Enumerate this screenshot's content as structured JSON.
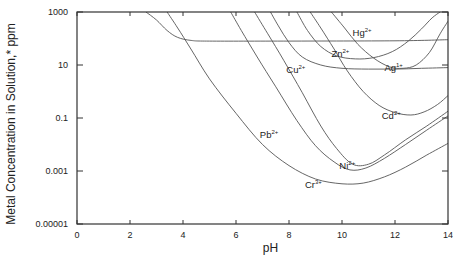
{
  "chart_data": {
    "type": "line",
    "title": "",
    "xlabel": "pH",
    "ylabel": "Metal Concentration in Solution,* ppm",
    "xlim": [
      0,
      14
    ],
    "ylim": [
      1e-05,
      1000
    ],
    "yscale": "log",
    "grid": false,
    "legend": "inline labels on curves",
    "x_ticks": [
      0,
      2,
      4,
      6,
      8,
      10,
      12,
      14
    ],
    "x_tick_labels": [
      "0",
      "2",
      "4",
      "6",
      "8",
      "10",
      "12",
      "14"
    ],
    "y_ticks": [
      1000,
      10,
      0.1,
      0.001,
      1e-05
    ],
    "y_tick_labels": [
      "1000",
      "10",
      "0.1",
      "0.001",
      "0.00001"
    ],
    "series": [
      {
        "name": "Hg2+",
        "base": "Hg",
        "charge": "2+",
        "label_pos": [
          10.4,
          120
        ],
        "points": [
          [
            2.6,
            1000
          ],
          [
            3.0,
            500
          ],
          [
            3.4,
            200
          ],
          [
            3.8,
            110
          ],
          [
            4.3,
            85
          ],
          [
            5,
            80
          ],
          [
            8,
            80
          ],
          [
            12,
            82
          ],
          [
            14,
            90
          ]
        ]
      },
      {
        "name": "Cr3+",
        "base": "Cr",
        "charge": "3+",
        "label_pos": [
          8.6,
          0.00022
        ],
        "points": [
          [
            3.4,
            1000
          ],
          [
            3.8,
            250
          ],
          [
            4.3,
            40
          ],
          [
            5,
            3
          ],
          [
            6,
            0.15
          ],
          [
            7,
            0.01
          ],
          [
            8,
            0.0016
          ],
          [
            9,
            0.0005
          ],
          [
            10,
            0.00033
          ],
          [
            10.8,
            0.00035
          ],
          [
            11.6,
            0.0006
          ],
          [
            12.4,
            0.0014
          ],
          [
            13.2,
            0.004
          ],
          [
            14,
            0.011
          ]
        ]
      },
      {
        "name": "Pb2+",
        "base": "Pb",
        "charge": "2+",
        "label_pos": [
          6.9,
          0.018
        ],
        "points": [
          [
            5.8,
            1000
          ],
          [
            6.2,
            200
          ],
          [
            6.8,
            20
          ],
          [
            7.5,
            1.5
          ],
          [
            8.3,
            0.08
          ],
          [
            9,
            0.009
          ],
          [
            9.7,
            0.0022
          ],
          [
            10.3,
            0.0011
          ],
          [
            10.9,
            0.0013
          ],
          [
            11.6,
            0.003
          ],
          [
            12.4,
            0.01
          ],
          [
            13.2,
            0.035
          ],
          [
            14,
            0.12
          ]
        ]
      },
      {
        "name": "Ni2+",
        "base": "Ni",
        "charge": "2+",
        "label_pos": [
          9.9,
          0.0012
        ],
        "points": [
          [
            6.7,
            1000
          ],
          [
            7.2,
            150
          ],
          [
            7.8,
            15
          ],
          [
            8.5,
            0.9
          ],
          [
            9.2,
            0.05
          ],
          [
            9.8,
            0.007
          ],
          [
            10.4,
            0.0018
          ],
          [
            11,
            0.0018
          ],
          [
            11.6,
            0.004
          ],
          [
            12.4,
            0.015
          ],
          [
            13.2,
            0.05
          ],
          [
            14,
            0.18
          ]
        ]
      },
      {
        "name": "Cu2+",
        "base": "Cu",
        "charge": "2+",
        "label_pos": [
          7.9,
          5
        ],
        "points": [
          [
            7.3,
            1000
          ],
          [
            7.6,
            300
          ],
          [
            8,
            70
          ],
          [
            8.5,
            20
          ],
          [
            9.2,
            10
          ],
          [
            10,
            7.5
          ],
          [
            11,
            7
          ],
          [
            12,
            7
          ],
          [
            13,
            7.5
          ],
          [
            14,
            8
          ]
        ]
      },
      {
        "name": "Zn2+",
        "base": "Zn",
        "charge": "2+",
        "label_pos": [
          9.6,
          20
        ],
        "points": [
          [
            8.3,
            1000
          ],
          [
            8.7,
            200
          ],
          [
            9.2,
            50
          ],
          [
            9.8,
            22
          ],
          [
            10.5,
            17
          ],
          [
            11.2,
            19
          ],
          [
            11.9,
            32
          ],
          [
            12.5,
            80
          ],
          [
            13,
            230
          ],
          [
            13.4,
            600
          ],
          [
            13.7,
            1000
          ]
        ]
      },
      {
        "name": "Cd2+",
        "base": "Cd",
        "charge": "2+",
        "label_pos": [
          11.5,
          0.09
        ],
        "points": [
          [
            8.8,
            1000
          ],
          [
            9.2,
            250
          ],
          [
            9.7,
            40
          ],
          [
            10.2,
            6
          ],
          [
            10.8,
            1
          ],
          [
            11.4,
            0.3
          ],
          [
            12,
            0.16
          ],
          [
            12.6,
            0.13
          ],
          [
            13.1,
            0.17
          ],
          [
            13.6,
            0.32
          ],
          [
            14,
            0.7
          ]
        ]
      },
      {
        "name": "Ag1+",
        "base": "Ag",
        "charge": "1+",
        "label_pos": [
          11.6,
          6
        ],
        "points": [
          [
            9.6,
            1000
          ],
          [
            10.1,
            250
          ],
          [
            10.6,
            60
          ],
          [
            11.2,
            18
          ],
          [
            11.8,
            8.5
          ],
          [
            12.3,
            7.5
          ],
          [
            12.8,
            10
          ],
          [
            13.3,
            30
          ],
          [
            13.7,
            150
          ],
          [
            14,
            450
          ]
        ]
      }
    ]
  },
  "plot_area": {
    "left": 77,
    "top": 12,
    "right": 448,
    "bottom": 224
  }
}
